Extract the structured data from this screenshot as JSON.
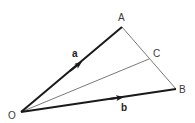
{
  "diagram": {
    "points": {
      "O": {
        "label": "O"
      },
      "A": {
        "label": "A"
      },
      "B": {
        "label": "B"
      },
      "C": {
        "label": "C"
      }
    },
    "vectors": [
      {
        "name": "a",
        "label": "a",
        "from": "O",
        "to": "A"
      },
      {
        "name": "b",
        "label": "b",
        "from": "O",
        "to": "B"
      }
    ],
    "segments": [
      {
        "from": "A",
        "to": "B"
      },
      {
        "from": "O",
        "to": "C"
      }
    ],
    "colors": {
      "vector": "#1a1a1a",
      "thin_line": "#555555",
      "label": "#3a3a3a"
    }
  }
}
